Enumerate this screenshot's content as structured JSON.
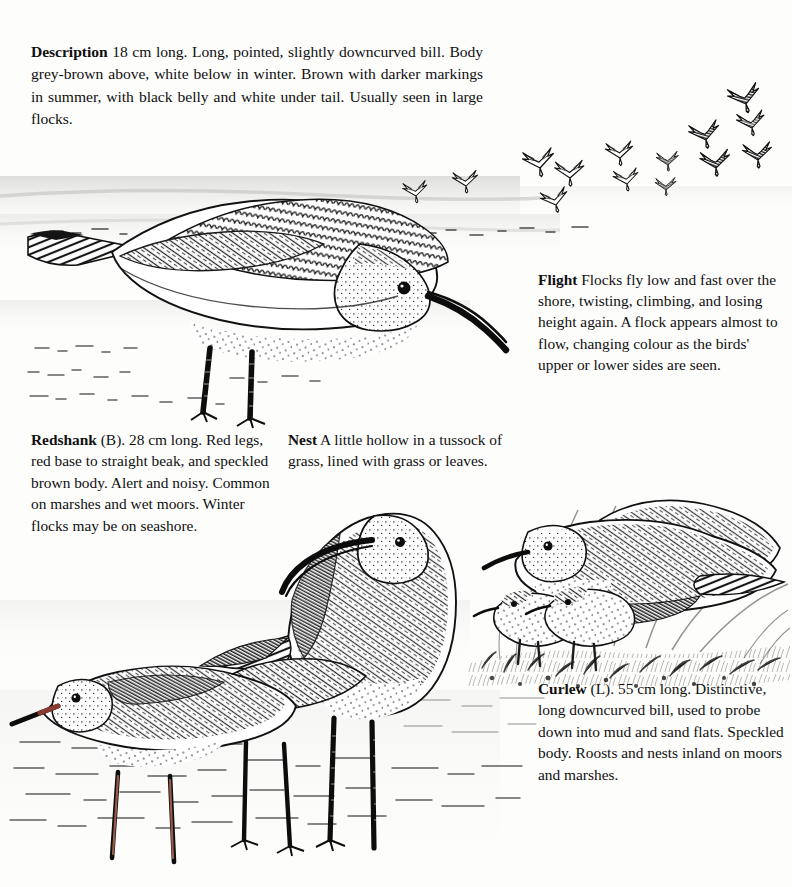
{
  "page": {
    "kind": "illustrated-field-guide-page",
    "background_color": "#fdfdfc",
    "ink_color": "#101010"
  },
  "blocks": {
    "description": {
      "lead": "Description",
      "body": "18 cm long. Long, pointed, slightly downcurved bill. Body grey-brown above, white below in winter. Brown with darker markings in summer, with black belly and white under tail. Usually seen in large flocks.",
      "lines": [
        "18 cm long. Long, pointed, slightly",
        "downcurved bill. Body grey-brown above, white be-",
        "low in winter. Brown with darker markings in sum-",
        "mer, with black belly and white under tail. Usually",
        "seen in large flocks."
      ]
    },
    "flight": {
      "lead": "Flight",
      "body": "Flocks fly low and fast over the shore, twisting, climbing, and losing height again. A flock appears almost to flow, changing colour as the birds' upper or lower sides are seen.",
      "lines": [
        "Flocks fly low",
        "and fast over the shore,",
        "twisting, climbing, and",
        "losing height again. A",
        "flock appears almost to",
        "flow, changing colour as",
        "the birds' upper or lower",
        "sides are seen."
      ]
    },
    "redshank": {
      "lead": "Redshank",
      "body": "(B). 28 cm long. Red legs, red base to straight beak, and speckled brown body. Alert and noisy. Common on marshes and wet moors. Winter flocks may be on seashore.",
      "lines": [
        "(B). 28 cm",
        "long. Red legs, red base",
        "to straight beak, and",
        "speckled brown body.",
        "Alert and noisy. Common",
        "on marshes and wet",
        "moors. Winter flocks",
        "may be on seashore."
      ]
    },
    "nest": {
      "lead": "Nest",
      "body": "A little hollow in a tussock of grass, lined with grass or leaves.",
      "lines": [
        "A little hollow in a",
        "tussock of grass, lined",
        "with grass or leaves."
      ]
    },
    "curlew": {
      "lead": "Curlew",
      "body": "(L). 55 cm long. Distinctive, long downcurved bill, used to probe down into mud and sand flats. Speckled body. Roosts and nests inland on moors and marshes.",
      "lines": [
        "(L). 55 cm long.",
        "Distinctive, long",
        "downcurved bill, used to",
        "probe down into mud",
        "and sand flats. Speckled",
        "body. Roosts and nests",
        "inland on moors and",
        "marshes."
      ]
    }
  },
  "illustrations": [
    {
      "name": "dunlin-winter-feeding",
      "caption_ref": "description",
      "notes": "Large pen-and-ink Dunlin in winter plumage, feeding on shoreline, bill pointing down-right"
    },
    {
      "name": "dunlin-flock-in-flight",
      "caption_ref": "flight",
      "bird_count": 13,
      "notes": "Flock of small waders in arrow/M silhouettes flying right over the sea"
    },
    {
      "name": "redshank-standing",
      "caption_ref": "redshank",
      "notes": "Redshank in foreground bottom-left with straight beak and long legs"
    },
    {
      "name": "curlew-standing",
      "caption_ref": "curlew",
      "notes": "Curlew with very long downcurved bill standing on wet sand"
    },
    {
      "name": "dunlin-pair-with-chicks",
      "caption_ref": "nest",
      "adult_count": 2,
      "chick_count": 2,
      "notes": "Two summer-plumage Dunlin with two downy chicks among tussock grass"
    }
  ]
}
